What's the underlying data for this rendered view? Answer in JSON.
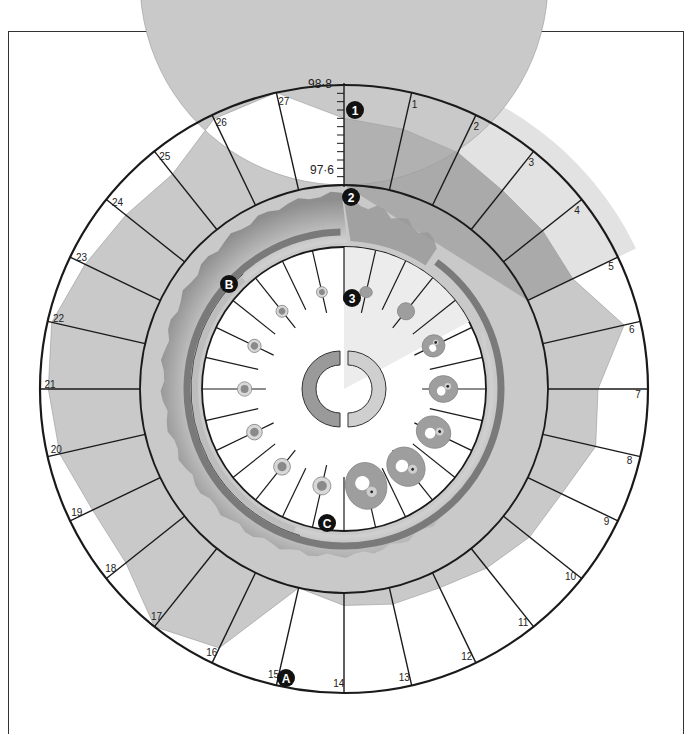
{
  "chart_data": {
    "type": "polar-area",
    "title": "",
    "days": [
      0,
      1,
      2,
      3,
      4,
      5,
      6,
      7,
      8,
      9,
      10,
      11,
      12,
      13,
      14,
      15,
      16,
      17,
      18,
      19,
      20,
      21,
      22,
      23,
      24,
      25,
      26,
      27
    ],
    "day_labels": [
      "",
      "1",
      "2",
      "3",
      "4",
      "5",
      "6",
      "7",
      "8",
      "9",
      "10",
      "11",
      "12",
      "13",
      "14",
      "15",
      "16",
      "17",
      "18",
      "19",
      "20",
      "21",
      "22",
      "23",
      "24",
      "25",
      "26",
      "27"
    ],
    "temperature_F": [
      98.4,
      98.35,
      98.3,
      98.2,
      98.2,
      98.2,
      98.6,
      98.2,
      98.25,
      98.05,
      98.0,
      97.9,
      97.8,
      97.8,
      97.75,
      97.6,
      98.6,
      98.8,
      98.5,
      98.5,
      98.65,
      98.7,
      98.75,
      98.6,
      98.5,
      98.45,
      98.75,
      98.8
    ],
    "scale": {
      "min": 97.6,
      "max": 98.8,
      "min_label": "97·6",
      "max_label": "98·8",
      "ticks": 13
    },
    "menstruation_days": [
      0,
      5
    ],
    "series": [
      {
        "name": "basal body temperature",
        "values_ref": "temperature_F"
      }
    ]
  },
  "rings": {
    "outer": {
      "label": "basal body temperature"
    },
    "middle": {
      "label": "uterine lining"
    },
    "inner": {
      "label": "ovary / follicle development"
    }
  },
  "markers": [
    {
      "id": "1",
      "label": "1",
      "ring": "temperature"
    },
    {
      "id": "2",
      "label": "2",
      "ring": "endometrium"
    },
    {
      "id": "3",
      "label": "3",
      "ring": "ovary"
    },
    {
      "id": "A",
      "label": "A",
      "note": "temperature dip at ovulation"
    },
    {
      "id": "B",
      "label": "B",
      "note": "start of arc"
    },
    {
      "id": "C",
      "label": "C",
      "note": "released ovum"
    }
  ],
  "colors": {
    "temp_fill": "#c9c9c9",
    "temp_fill_dark": "#9c9c9c",
    "menses_band": "#e2e2e2",
    "lining": "#a8a8a8",
    "arc_dark": "#7a7a7a",
    "arc_light": "#bdbdbd",
    "line": "#1a1a1a"
  }
}
